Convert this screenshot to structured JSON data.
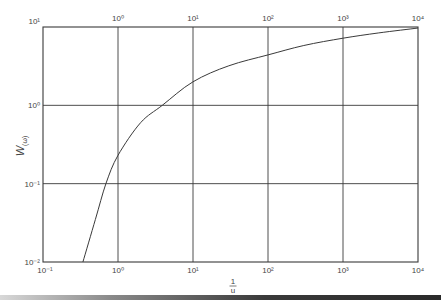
{
  "chart_data": {
    "type": "line",
    "title": "",
    "xlabel": "1/u",
    "ylabel": "W(ω)",
    "xscale": "log",
    "yscale": "log",
    "xlim": [
      0.1,
      10000
    ],
    "ylim": [
      0.01,
      10
    ],
    "grid": true,
    "legend": null,
    "x_tick_labels_bottom": [
      "10⁻¹",
      "10⁰",
      "10¹",
      "10²",
      "10³",
      "10⁴"
    ],
    "x_tick_labels_top": [
      "10⁰",
      "10¹",
      "10²",
      "10³",
      "10⁴"
    ],
    "y_tick_labels": [
      "10¹",
      "10⁰",
      "10⁻¹",
      "10⁻²"
    ],
    "series": [
      {
        "name": "W(ω)",
        "x": [
          0.34,
          0.5,
          0.69,
          1,
          2,
          3.9,
          10,
          30,
          100,
          300,
          1000,
          3000,
          10000
        ],
        "y": [
          0.01,
          0.035,
          0.1,
          0.23,
          0.6,
          1.0,
          2.0,
          3.2,
          4.4,
          5.8,
          7.2,
          8.4,
          9.7
        ]
      }
    ]
  },
  "labels": {
    "xlabel_num": "1",
    "xlabel_den": "u",
    "ylabel_main": "W",
    "ylabel_sub": "(ω)"
  },
  "colors": {
    "axis": "#3a3a3a",
    "grid": "#3a3a3a",
    "curve": "#3a3a3a",
    "text": "#444444"
  }
}
